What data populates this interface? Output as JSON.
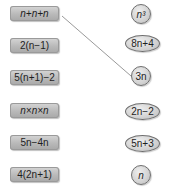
{
  "left_expressions": [
    {
      "label": "n+n+n"
    },
    {
      "label": "2(n−1)"
    },
    {
      "label": "5(n+1)−2"
    },
    {
      "label": "n×n×n"
    },
    {
      "label": "5n−4n"
    },
    {
      "label": "4(2n+1)"
    }
  ],
  "right_expressions": [
    {
      "label": "n³",
      "shape": "circle"
    },
    {
      "label": "8n+4",
      "shape": "ellipse"
    },
    {
      "label": "3n",
      "shape": "circle"
    },
    {
      "label": "2n−2",
      "shape": "ellipse"
    },
    {
      "label": "5n+3",
      "shape": "ellipse"
    },
    {
      "label": "n",
      "shape": "circle"
    }
  ],
  "connections": [
    {
      "from": "n+n+n",
      "to": "3n"
    }
  ],
  "colors": {
    "box_fill": "#b9b9b9",
    "oval_fill": "#d2d2d2",
    "line": "#999999"
  }
}
